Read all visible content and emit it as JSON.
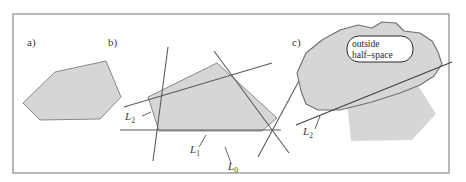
{
  "figure": {
    "frame": {
      "color": "#8a8a8a",
      "x": 13,
      "y": 14,
      "width": 436,
      "height": 159
    },
    "background": "#ffffff",
    "shape_fill": "#d6d6d6",
    "shape_stroke": "#6f6f6f",
    "line_color": "#5b5b5b",
    "label_color": "#3a3a3a"
  },
  "panels": [
    {
      "id": "a",
      "label": "a)",
      "label_x": 27,
      "label_y": 46,
      "description": "convex polygon alone"
    },
    {
      "id": "b",
      "label": "b)",
      "label_x": 108,
      "label_y": 46,
      "description": "polygon with bounding lines L0 L1 L2"
    },
    {
      "id": "c",
      "label": "c)",
      "label_x": 292,
      "label_y": 46,
      "description": "outside half-space blob over polygon"
    }
  ],
  "panel_a": {
    "polygon_points": "23,103 55,72 106,61 121,97 100,119 40,120"
  },
  "panel_b": {
    "polygon_points": "148,97 217,63 277,118 262,131 159,131",
    "lines": [
      {
        "name": "L0",
        "x1": 214,
        "y1": 51,
        "x2": 289,
        "y2": 153
      },
      {
        "name": "L1",
        "x1": 168,
        "y1": 47,
        "x2": 153,
        "y2": 161
      },
      {
        "name": "L2",
        "x1": 124,
        "y1": 107,
        "x2": 272,
        "y2": 63
      },
      {
        "name": "horizontal",
        "x1": 120,
        "y1": 130,
        "x2": 281,
        "y2": 130
      },
      {
        "name": "diagonal-right",
        "x1": 258,
        "y1": 157,
        "x2": 300,
        "y2": 79
      }
    ],
    "labels": [
      {
        "name": "L2",
        "base": "L",
        "sub": "2",
        "x": 125,
        "y": 120,
        "leader": {
          "x1": 142,
          "y1": 116,
          "x2": 151,
          "y2": 112
        }
      },
      {
        "name": "L1",
        "base": "L",
        "sub": "1",
        "x": 190,
        "y": 153,
        "leader": {
          "x1": 199,
          "y1": 147,
          "x2": 206,
          "y2": 135
        }
      },
      {
        "name": "L0",
        "base": "L",
        "sub": "0",
        "x": 228,
        "y": 170,
        "leader": {
          "x1": 231,
          "y1": 163,
          "x2": 225,
          "y2": 147
        }
      }
    ]
  },
  "panel_c": {
    "polygon_points": "345,83 380,76 414,79 436,114 412,140 351,141",
    "blob_points": "301,91 297,73 306,53 322,40 340,30 358,25 372,28 382,22 396,23 404,31 420,33 432,41 438,52 442,64 434,76 420,85 400,93 372,102 340,110 318,110 306,104",
    "tangent_line": {
      "x1": 296,
      "y1": 125,
      "x2": 452,
      "y2": 62
    },
    "callout": {
      "lines": [
        "outside",
        "half–space"
      ],
      "x": 347,
      "y": 36,
      "width": 66,
      "height": 26,
      "fill": "#ffffff",
      "stroke": "#2b2b2b"
    },
    "label": {
      "name": "L2",
      "base": "L",
      "sub": "2",
      "x": 303,
      "y": 135,
      "leader": {
        "x1": 315,
        "y1": 129,
        "x2": 320,
        "y2": 116
      }
    }
  }
}
